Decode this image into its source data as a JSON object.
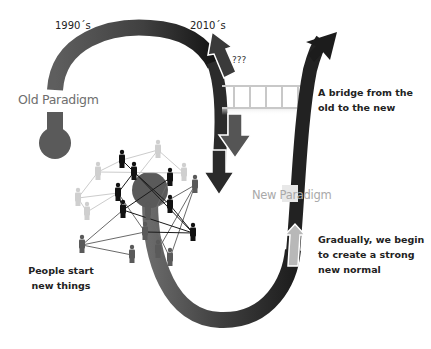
{
  "labels": {
    "era_1990": "1990´s",
    "era_2010": "2010´s",
    "unknown": "???",
    "old_paradigm": "Old Paradigm",
    "new_paradigm": "New Paradigm",
    "bridge": [
      "A bridge from the",
      "old to the new"
    ],
    "people": [
      "People start",
      "new things"
    ],
    "gradually": [
      "Gradually, we begin",
      "to create a strong",
      "new normal"
    ]
  },
  "colors": {
    "old_path": "#5a5a5a",
    "old_path_dark": "#1e1e1e",
    "new_path": "#262626",
    "bridge_rail": "#c8c8c8",
    "new_paradigm_text": "#a9a9a9",
    "old_paradigm_text": "#6e6e6e",
    "up_arrow": "#b8b8b8",
    "down_arrow": "#555555"
  },
  "network": {
    "people_colors": [
      "#111111",
      "#5a5a5a",
      "#c8c8c8"
    ]
  }
}
